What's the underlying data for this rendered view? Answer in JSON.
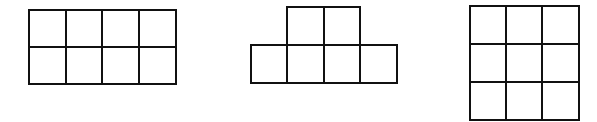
{
  "figure": {
    "stroke_color": "#111111",
    "background_color": "#ffffff",
    "shapes": [
      {
        "id": "shape-2x4-rectangle",
        "label": "2 rows x 4 columns rectangle",
        "cell_count": 8,
        "cells": [
          {
            "x": 29,
            "y": 10,
            "w": 37,
            "h": 37
          },
          {
            "x": 66,
            "y": 10,
            "w": 36,
            "h": 37
          },
          {
            "x": 102,
            "y": 10,
            "w": 37,
            "h": 37
          },
          {
            "x": 139,
            "y": 10,
            "w": 37,
            "h": 37
          },
          {
            "x": 29,
            "y": 47,
            "w": 37,
            "h": 37
          },
          {
            "x": 66,
            "y": 47,
            "w": 36,
            "h": 37
          },
          {
            "x": 102,
            "y": 47,
            "w": 37,
            "h": 37
          },
          {
            "x": 139,
            "y": 47,
            "w": 37,
            "h": 37
          }
        ]
      },
      {
        "id": "shape-t-hexomino",
        "label": "2 cells on top of a row of 4 cells",
        "cell_count": 6,
        "cells": [
          {
            "x": 287,
            "y": 7,
            "w": 37,
            "h": 38
          },
          {
            "x": 324,
            "y": 7,
            "w": 36,
            "h": 38
          },
          {
            "x": 251,
            "y": 45,
            "w": 36,
            "h": 38
          },
          {
            "x": 287,
            "y": 45,
            "w": 37,
            "h": 38
          },
          {
            "x": 324,
            "y": 45,
            "w": 36,
            "h": 38
          },
          {
            "x": 360,
            "y": 45,
            "w": 37,
            "h": 38
          }
        ]
      },
      {
        "id": "shape-3x3-square",
        "label": "3 rows x 3 columns square",
        "cell_count": 9,
        "cells": [
          {
            "x": 470,
            "y": 6,
            "w": 36,
            "h": 38
          },
          {
            "x": 506,
            "y": 6,
            "w": 36,
            "h": 38
          },
          {
            "x": 542,
            "y": 6,
            "w": 37,
            "h": 38
          },
          {
            "x": 470,
            "y": 44,
            "w": 36,
            "h": 38
          },
          {
            "x": 506,
            "y": 44,
            "w": 36,
            "h": 38
          },
          {
            "x": 542,
            "y": 44,
            "w": 37,
            "h": 38
          },
          {
            "x": 470,
            "y": 82,
            "w": 36,
            "h": 38
          },
          {
            "x": 506,
            "y": 82,
            "w": 36,
            "h": 38
          },
          {
            "x": 542,
            "y": 82,
            "w": 37,
            "h": 38
          }
        ]
      }
    ]
  }
}
